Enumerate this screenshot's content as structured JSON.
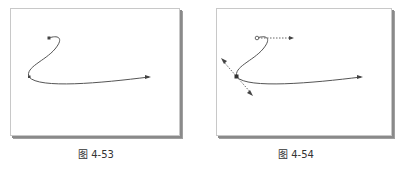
{
  "figures": [
    {
      "caption": "图 4-53",
      "description": "Bezier curve with three nodes, no handles shown"
    },
    {
      "caption": "图 4-54",
      "description": "Same bezier curve with selected node showing dashed control handles and arrow directions"
    }
  ],
  "colors": {
    "curve": "#555555",
    "handle": "#666666",
    "node": "#444444",
    "frame": "#c8c8c8",
    "shadow": "#8a8a8a",
    "caption": "#333333"
  }
}
